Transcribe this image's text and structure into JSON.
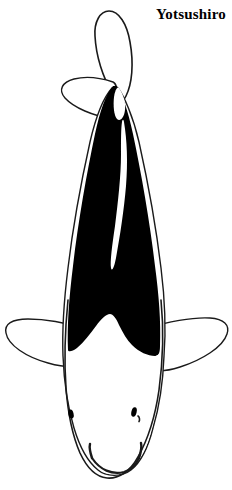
{
  "page": {
    "background_color": "#ffffff",
    "width": 232,
    "height": 490
  },
  "title": {
    "text": "Yotsushiro",
    "color": "#000000",
    "weight": "bold",
    "position": "top-right"
  },
  "illustration": {
    "subject": "koi-fish-top-view",
    "orientation": "vertical, tail at top, head at bottom",
    "outline_color": "#1a1a1a",
    "body_black_color": "#000000",
    "body_white_color": "#ffffff",
    "parts": [
      {
        "name": "caudal-fin",
        "label": "Caudal fin",
        "fill": "#ffffff",
        "stroke": "#1a1a1a"
      },
      {
        "name": "dorsal-fin-left",
        "label": "Left trailing fin",
        "fill": "#ffffff",
        "stroke": "#1a1a1a"
      },
      {
        "name": "body-black-region",
        "label": "Black body",
        "fill": "#000000",
        "stroke": "#000000"
      },
      {
        "name": "body-white-stripe",
        "label": "White dorsal stripe",
        "fill": "#ffffff",
        "stroke": "none"
      },
      {
        "name": "pectoral-fin-left",
        "label": "Left pectoral fin",
        "fill": "#ffffff",
        "stroke": "#1a1a1a"
      },
      {
        "name": "pectoral-fin-right",
        "label": "Right pectoral fin",
        "fill": "#ffffff",
        "stroke": "#1a1a1a"
      },
      {
        "name": "head-white-region",
        "label": "White head",
        "fill": "#ffffff",
        "stroke": "#1a1a1a"
      },
      {
        "name": "eye-left",
        "label": "Left eye",
        "fill": "#000000"
      },
      {
        "name": "eye-right",
        "label": "Right eye",
        "fill": "#000000"
      },
      {
        "name": "barbel-left",
        "label": "Left barbel",
        "stroke": "#1a1a1a"
      },
      {
        "name": "barbel-right",
        "label": "Right barbel",
        "stroke": "#1a1a1a"
      },
      {
        "name": "mouth",
        "label": "Mouth",
        "stroke": "#1a1a1a"
      }
    ]
  }
}
